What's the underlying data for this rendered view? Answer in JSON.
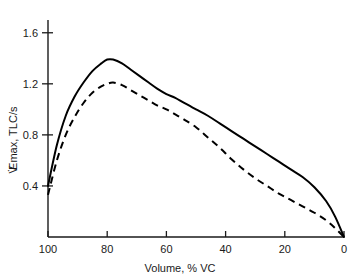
{
  "chart_data": {
    "type": "line",
    "title": "",
    "xlabel": "Volume, % VC",
    "ylabel": "V̇Emax, TLC/s",
    "ylabel_plain": "VEmax, TLC/s",
    "xlim": [
      100,
      0
    ],
    "ylim": [
      0,
      1.7
    ],
    "x_axis_reversed": true,
    "grid": false,
    "legend": "none",
    "xticks": [
      100,
      80,
      60,
      40,
      20,
      0
    ],
    "xtick_labels": [
      "100",
      "80",
      "60",
      "40",
      "20",
      "0"
    ],
    "yticks": [
      0.4,
      0.8,
      1.2,
      1.6
    ],
    "ytick_labels": [
      "0.4",
      "0.8",
      "1.2",
      "1.6"
    ],
    "series": [
      {
        "name": "solid-curve",
        "style": "solid",
        "color": "#000000",
        "peak_x": 80,
        "peak_y": 1.39,
        "x": [
          100,
          97,
          94,
          91,
          88,
          85,
          82,
          80,
          78,
          75,
          72,
          69,
          66,
          63,
          60,
          57,
          54,
          50,
          46,
          42,
          38,
          34,
          30,
          26,
          22,
          18,
          14,
          10,
          6,
          3,
          0
        ],
        "y": [
          0.4,
          0.72,
          0.95,
          1.1,
          1.21,
          1.3,
          1.36,
          1.39,
          1.39,
          1.36,
          1.31,
          1.26,
          1.21,
          1.16,
          1.12,
          1.09,
          1.05,
          1.0,
          0.95,
          0.89,
          0.83,
          0.77,
          0.71,
          0.65,
          0.59,
          0.53,
          0.47,
          0.39,
          0.28,
          0.16,
          0.0
        ]
      },
      {
        "name": "dashed-curve",
        "style": "dashed",
        "color": "#000000",
        "peak_x": 78,
        "peak_y": 1.21,
        "x": [
          100,
          97,
          94,
          91,
          88,
          85,
          82,
          80,
          78,
          75,
          72,
          69,
          66,
          63,
          60,
          57,
          54,
          50,
          46,
          42,
          38,
          34,
          30,
          26,
          22,
          18,
          14,
          10,
          6,
          3,
          0
        ],
        "y": [
          0.33,
          0.6,
          0.8,
          0.94,
          1.05,
          1.13,
          1.18,
          1.2,
          1.21,
          1.19,
          1.15,
          1.11,
          1.07,
          1.03,
          1.0,
          0.96,
          0.92,
          0.86,
          0.78,
          0.7,
          0.61,
          0.53,
          0.46,
          0.4,
          0.34,
          0.29,
          0.24,
          0.19,
          0.13,
          0.07,
          0.0
        ]
      }
    ]
  }
}
